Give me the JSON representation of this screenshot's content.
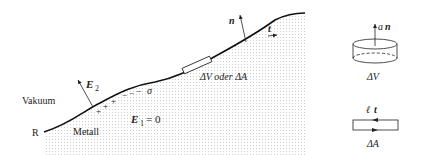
{
  "diagram": {
    "regions": {
      "vacuum_label": "Vakuum",
      "metal_label": "Metall",
      "boundary_label": "R"
    },
    "fields": {
      "outside": "E",
      "outside_sub": "2",
      "inside": "E",
      "inside_sub": "1",
      "inside_eq": "= 0"
    },
    "charges": {
      "plus": "+ + +",
      "minus": "− − −",
      "sigma": "σ"
    },
    "surface_vectors": {
      "normal": "n",
      "tangent": "t"
    },
    "element_label": "ΔV oder ΔA",
    "inset_volume": {
      "arrow_label_a": "a",
      "arrow_label_n": "n",
      "caption": "ΔV"
    },
    "inset_area": {
      "arrow_label_l": "ℓ",
      "arrow_label_t": "t",
      "caption": "ΔA"
    }
  }
}
